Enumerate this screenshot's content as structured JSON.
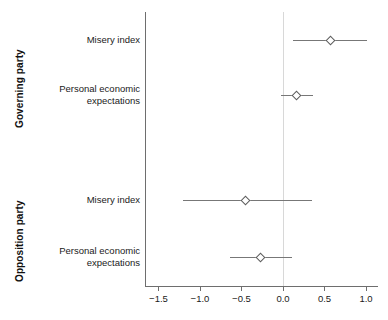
{
  "chart_data": {
    "type": "scatter",
    "title": "",
    "subtitle": "",
    "xlabel": "",
    "ylabel": "",
    "xlim": [
      -1.65,
      1.1
    ],
    "xticks": [
      -1.5,
      -1.0,
      -0.5,
      0.0,
      0.5,
      1.0
    ],
    "xticklabels": [
      "−1.5",
      "−1.0",
      "−0.5",
      "0.0",
      "0.5",
      "1.0"
    ],
    "grid": false,
    "legend": "none",
    "reference_line": 0.0,
    "orientation": "horizontal",
    "marker": "open-diamond",
    "groups": [
      {
        "name": "Governing party",
        "rows": [
          {
            "label": "Misery index",
            "estimate": 0.57,
            "ci_low": 0.12,
            "ci_high": 1.01
          },
          {
            "label": "Personal economic\nexpectations",
            "estimate": 0.16,
            "ci_low": -0.02,
            "ci_high": 0.36
          }
        ]
      },
      {
        "name": "Opposition party",
        "rows": [
          {
            "label": "Misery index",
            "estimate": -0.45,
            "ci_low": -1.2,
            "ci_high": 0.35
          },
          {
            "label": "Personal economic\nexpectations",
            "estimate": -0.27,
            "ci_low": -0.64,
            "ci_high": 0.11
          }
        ]
      }
    ],
    "colors": {
      "axis": "#6e6e6e",
      "interval": "#777777",
      "marker_edge": "#5d5d5d",
      "marker_fill": "#ffffff",
      "reference_line": "#d8d8d8",
      "text": "#1a1a1a",
      "background": "#ffffff"
    }
  },
  "layout": {
    "row_y": [
      40,
      95,
      200,
      257
    ],
    "plot_left_px": 145,
    "plot_top_px": 12,
    "plot_bottom_px": 286,
    "x_zero_px": 283,
    "x_unit_px": 83
  }
}
